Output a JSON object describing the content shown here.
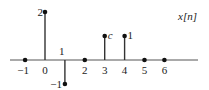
{
  "chart_data": {
    "type": "stem",
    "title": "x[n]",
    "xlabel": "",
    "ylabel": "",
    "x": [
      -1,
      0,
      1,
      2,
      3,
      4,
      5,
      6
    ],
    "values": [
      0,
      2,
      -1,
      0,
      1,
      1,
      0,
      0
    ],
    "value_labels": [
      "",
      "2",
      "-1",
      "",
      "c",
      "1",
      "",
      ""
    ],
    "value_label_italic": [
      false,
      false,
      false,
      false,
      true,
      false,
      false,
      false
    ],
    "tick_labels": [
      "-1",
      "0",
      "1",
      "2",
      "3",
      "4",
      "5",
      "6"
    ],
    "xlim": [
      -1.7,
      7.6
    ],
    "ylim": [
      -1.2,
      2.3
    ],
    "grid": false,
    "legend": "none",
    "annotations": [
      {
        "text": "c",
        "at_n": 3,
        "note": "symbolic value at n=3, drawn at height 1"
      }
    ]
  }
}
